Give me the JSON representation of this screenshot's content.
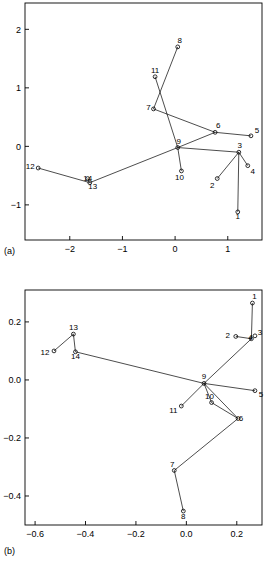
{
  "figure": {
    "panel_a_tag": "(a)",
    "panel_b_tag": "(b)"
  },
  "chart_data": [
    {
      "type": "scatter",
      "title": "",
      "panel": "(a)",
      "xlabel": "",
      "ylabel": "",
      "xlim": [
        -2.85,
        1.65
      ],
      "ylim": [
        -1.6,
        2.45
      ],
      "xticks": [
        -2,
        -1,
        0,
        1
      ],
      "xticklabels": [
        "-2",
        "-1",
        "0",
        "1"
      ],
      "yticks": [
        -1,
        0,
        1,
        2
      ],
      "yticklabels": [
        "-1",
        "0",
        "1",
        "2"
      ],
      "grid": false,
      "legend": "none",
      "point_labels": [
        "1",
        "2",
        "3",
        "4",
        "5",
        "6",
        "7",
        "8",
        "9",
        "10",
        "11",
        "12",
        "13",
        "14"
      ],
      "points": [
        {
          "label": "1",
          "x": 1.19,
          "y": -1.12
        },
        {
          "label": "2",
          "x": 0.8,
          "y": -0.55
        },
        {
          "label": "3",
          "x": 1.21,
          "y": -0.1
        },
        {
          "label": "4",
          "x": 1.38,
          "y": -0.33
        },
        {
          "label": "5",
          "x": 1.44,
          "y": 0.18
        },
        {
          "label": "6",
          "x": 0.76,
          "y": 0.24
        },
        {
          "label": "7",
          "x": -0.41,
          "y": 0.64
        },
        {
          "label": "8",
          "x": 0.05,
          "y": 1.7
        },
        {
          "label": "9",
          "x": 0.05,
          "y": -0.02
        },
        {
          "label": "10",
          "x": 0.12,
          "y": -0.42
        },
        {
          "label": "11",
          "x": -0.38,
          "y": 1.19
        },
        {
          "label": "12",
          "x": -2.6,
          "y": -0.37
        },
        {
          "label": "13",
          "x": -1.62,
          "y": -0.62
        },
        {
          "label": "14",
          "x": -1.66,
          "y": -0.55
        }
      ],
      "edges": [
        [
          "1",
          "3"
        ],
        [
          "2",
          "3"
        ],
        [
          "3",
          "4"
        ],
        [
          "3",
          "9"
        ],
        [
          "5",
          "6"
        ],
        [
          "6",
          "9"
        ],
        [
          "6",
          "7"
        ],
        [
          "8",
          "7"
        ],
        [
          "11",
          "9"
        ],
        [
          "9",
          "10"
        ],
        [
          "9",
          "13"
        ],
        [
          "13",
          "12"
        ],
        [
          "13",
          "14"
        ]
      ]
    },
    {
      "type": "scatter",
      "title": "",
      "panel": "(b)",
      "xlabel": "",
      "ylabel": "",
      "xlim": [
        -0.64,
        0.3
      ],
      "ylim": [
        -0.5,
        0.31
      ],
      "xticks": [
        -0.6,
        -0.4,
        -0.2,
        0.0,
        0.2
      ],
      "xticklabels": [
        "-0.6",
        "-0.4",
        "-0.2",
        "0.0",
        "0.2"
      ],
      "yticks": [
        -0.4,
        -0.2,
        0.0,
        0.2
      ],
      "yticklabels": [
        "-0.4",
        "-0.2",
        "0.0",
        "0.2"
      ],
      "grid": false,
      "legend": "none",
      "point_labels": [
        "1",
        "2",
        "3",
        "4",
        "5",
        "6",
        "7",
        "8",
        "9",
        "10",
        "11",
        "12",
        "13",
        "14"
      ],
      "points": [
        {
          "label": "1",
          "x": 0.262,
          "y": 0.265
        },
        {
          "label": "2",
          "x": 0.196,
          "y": 0.15
        },
        {
          "label": "3",
          "x": 0.272,
          "y": 0.152
        },
        {
          "label": "4",
          "x": 0.258,
          "y": 0.142
        },
        {
          "label": "5",
          "x": 0.272,
          "y": -0.037
        },
        {
          "label": "6",
          "x": 0.205,
          "y": -0.133
        },
        {
          "label": "7",
          "x": -0.048,
          "y": -0.312
        },
        {
          "label": "8",
          "x": -0.012,
          "y": -0.452
        },
        {
          "label": "9",
          "x": 0.07,
          "y": -0.012
        },
        {
          "label": "10",
          "x": 0.1,
          "y": -0.078
        },
        {
          "label": "11",
          "x": -0.02,
          "y": -0.09
        },
        {
          "label": "12",
          "x": -0.525,
          "y": 0.1
        },
        {
          "label": "13",
          "x": -0.448,
          "y": 0.158
        },
        {
          "label": "14",
          "x": -0.44,
          "y": 0.097
        }
      ],
      "edges": [
        [
          "1",
          "4"
        ],
        [
          "2",
          "4"
        ],
        [
          "4",
          "9"
        ],
        [
          "9",
          "5"
        ],
        [
          "9",
          "10"
        ],
        [
          "10",
          "6"
        ],
        [
          "9",
          "6"
        ],
        [
          "6",
          "7"
        ],
        [
          "7",
          "8"
        ],
        [
          "9",
          "11"
        ],
        [
          "9",
          "14"
        ],
        [
          "14",
          "13"
        ],
        [
          "13",
          "12"
        ]
      ]
    }
  ]
}
